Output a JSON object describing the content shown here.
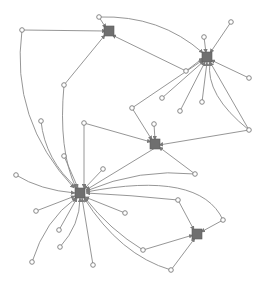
{
  "diagram": {
    "type": "directed-network-graph",
    "colors": {
      "hub": "#6f6f6f",
      "edge": "#8a8a8a",
      "leaf_stroke": "#7a7a7a",
      "background": "#ffffff"
    },
    "hubs": [
      {
        "id": "H1",
        "x": 109,
        "y": 31
      },
      {
        "id": "H2",
        "x": 207,
        "y": 57
      },
      {
        "id": "H3",
        "x": 155,
        "y": 144
      },
      {
        "id": "H4",
        "x": 80,
        "y": 193
      },
      {
        "id": "H5",
        "x": 197,
        "y": 234
      }
    ],
    "leaves": [
      {
        "id": "L1",
        "x": 22,
        "y": 30
      },
      {
        "id": "L2",
        "x": 99,
        "y": 17
      },
      {
        "id": "L3",
        "x": 64,
        "y": 85
      },
      {
        "id": "L4",
        "x": 186,
        "y": 71
      },
      {
        "id": "L5",
        "x": 204,
        "y": 37
      },
      {
        "id": "L6",
        "x": 231,
        "y": 22
      },
      {
        "id": "L7",
        "x": 249,
        "y": 78
      },
      {
        "id": "L8",
        "x": 180,
        "y": 111
      },
      {
        "id": "L9",
        "x": 202,
        "y": 102
      },
      {
        "id": "L10",
        "x": 249,
        "y": 130
      },
      {
        "id": "L11",
        "x": 154,
        "y": 124
      },
      {
        "id": "L12",
        "x": 132,
        "y": 108
      },
      {
        "id": "L13",
        "x": 162,
        "y": 98
      },
      {
        "id": "L14",
        "x": 41,
        "y": 121
      },
      {
        "id": "L15",
        "x": 84,
        "y": 123
      },
      {
        "id": "L16",
        "x": 64,
        "y": 156
      },
      {
        "id": "L17",
        "x": 103,
        "y": 169
      },
      {
        "id": "L18",
        "x": 16,
        "y": 175
      },
      {
        "id": "L19",
        "x": 36,
        "y": 211
      },
      {
        "id": "L20",
        "x": 125,
        "y": 213
      },
      {
        "id": "L21",
        "x": 59,
        "y": 230
      },
      {
        "id": "L22",
        "x": 60,
        "y": 247
      },
      {
        "id": "L23",
        "x": 32,
        "y": 262
      },
      {
        "id": "L24",
        "x": 93,
        "y": 265
      },
      {
        "id": "L25",
        "x": 195,
        "y": 174
      },
      {
        "id": "L26",
        "x": 178,
        "y": 200
      },
      {
        "id": "L27",
        "x": 223,
        "y": 220
      },
      {
        "id": "L28",
        "x": 143,
        "y": 250
      },
      {
        "id": "L29",
        "x": 171,
        "y": 270
      }
    ],
    "edges": [
      {
        "d": "M22,30 L106,31"
      },
      {
        "d": "M22,30 Q10,120 74,188"
      },
      {
        "d": "M99,17 L106,28"
      },
      {
        "d": "M99,17 Q160,15 203,53"
      },
      {
        "d": "M64,85 L105,35"
      },
      {
        "d": "M64,85 Q58,150 76,188"
      },
      {
        "d": "M186,71 L112,35"
      },
      {
        "d": "M186,71 L203,58"
      },
      {
        "d": "M204,37 L206,53"
      },
      {
        "d": "M231,22 L210,53"
      },
      {
        "d": "M249,78 L211,60"
      },
      {
        "d": "M180,111 L205,62"
      },
      {
        "d": "M202,102 L207,62"
      },
      {
        "d": "M249,130 L210,62"
      },
      {
        "d": "M249,130 L159,145"
      },
      {
        "d": "M249,130 Q205,95 210,62"
      },
      {
        "d": "M154,124 L155,140"
      },
      {
        "d": "M132,108 L152,140"
      },
      {
        "d": "M132,108 L203,60"
      },
      {
        "d": "M162,98 L204,61"
      },
      {
        "d": "M84,123 L84,188"
      },
      {
        "d": "M84,123 L151,142"
      },
      {
        "d": "M41,121 Q45,160 77,188"
      },
      {
        "d": "M64,156 L78,188"
      },
      {
        "d": "M103,169 L84,189"
      },
      {
        "d": "M16,175 Q40,190 75,193"
      },
      {
        "d": "M36,211 L75,196"
      },
      {
        "d": "M125,213 L85,197"
      },
      {
        "d": "M59,230 L77,198"
      },
      {
        "d": "M60,247 Q80,225 80,198"
      },
      {
        "d": "M32,262 Q45,220 76,198"
      },
      {
        "d": "M93,265 L82,198"
      },
      {
        "d": "M155,148 L86,190"
      },
      {
        "d": "M195,174 L159,147"
      },
      {
        "d": "M195,174 Q140,168 86,191"
      },
      {
        "d": "M178,200 Q130,195 86,193"
      },
      {
        "d": "M178,200 L194,230"
      },
      {
        "d": "M223,220 L201,232"
      },
      {
        "d": "M223,220 Q200,170 86,192"
      },
      {
        "d": "M143,250 L193,235"
      },
      {
        "d": "M143,250 Q110,230 85,198"
      },
      {
        "d": "M171,270 L195,238"
      },
      {
        "d": "M171,270 Q120,255 84,198"
      }
    ]
  }
}
